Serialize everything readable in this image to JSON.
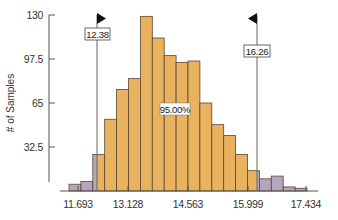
{
  "chart_data": {
    "type": "bar",
    "title": "",
    "xlabel": "",
    "ylabel": "# of Samples",
    "ylim": [
      0,
      130
    ],
    "yticks": [
      32.5,
      65,
      97.5,
      130
    ],
    "ytick_labels": [
      "32.5",
      "65",
      "97.5",
      "130"
    ],
    "xtick_labels": [
      "11.693",
      "13.128",
      "14.563",
      "15.999",
      "17.434"
    ],
    "xticks": [
      11.693,
      13.128,
      14.563,
      15.999,
      17.434
    ],
    "grid": false,
    "legend": null,
    "bins": 20,
    "values": [
      5,
      7,
      27,
      53,
      75,
      83,
      129,
      113,
      100,
      95,
      96,
      65,
      49,
      41,
      27,
      15,
      9,
      11,
      3,
      2
    ],
    "colors": {
      "inside": "#e9b25e",
      "outside": "#b4a7bd",
      "bar_stroke": "#5a4630",
      "axis": "#555555",
      "flag": "#111111"
    },
    "cutoffs": {
      "lower": {
        "value": "12.38",
        "flag_direction": "right"
      },
      "upper": {
        "value": "16.26",
        "flag_direction": "left"
      }
    },
    "annotation": "95.00%"
  }
}
